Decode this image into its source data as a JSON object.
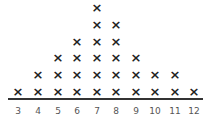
{
  "chart_data": {
    "type": "dot",
    "title": "",
    "xlabel": "",
    "ylabel": "",
    "marker": "x",
    "categories": [
      3,
      4,
      5,
      6,
      7,
      8,
      9,
      10,
      11,
      12
    ],
    "values": [
      1,
      2,
      3,
      4,
      6,
      5,
      3,
      2,
      2,
      1
    ],
    "xlim": [
      3,
      12
    ],
    "grid": false,
    "legend": null
  },
  "layout": {
    "col_x": [
      18,
      38,
      58,
      77,
      97,
      116,
      136,
      155,
      175,
      194
    ],
    "base_y": 92,
    "row_step": 16.8
  }
}
